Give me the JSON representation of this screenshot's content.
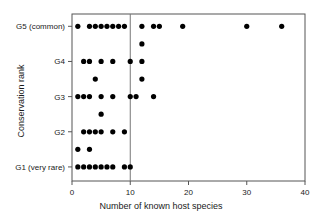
{
  "chart_data": {
    "type": "scatter",
    "title": "",
    "xlabel": "Number of known host species",
    "ylabel": "Conservation rank",
    "xlim": [
      0,
      40
    ],
    "ylim": [
      0.6,
      5.35
    ],
    "grid": false,
    "legend": null,
    "x_ticks": [
      0,
      10,
      20,
      30,
      40
    ],
    "x_tick_labels": [
      "0",
      "10",
      "20",
      "30",
      "40"
    ],
    "y_ticks": [
      1,
      2,
      3,
      4,
      5
    ],
    "y_tick_labels": [
      "G1 (very rare)",
      "G2",
      "G3",
      "G4",
      "G5 (common)"
    ],
    "reference_line_x": 10,
    "marker": "filled-circle",
    "marker_color": "#000000",
    "points": [
      {
        "x": 1,
        "y": 5
      },
      {
        "x": 3,
        "y": 5
      },
      {
        "x": 4,
        "y": 5
      },
      {
        "x": 5,
        "y": 5
      },
      {
        "x": 6,
        "y": 5
      },
      {
        "x": 7,
        "y": 5
      },
      {
        "x": 8,
        "y": 5
      },
      {
        "x": 9,
        "y": 5
      },
      {
        "x": 12,
        "y": 5
      },
      {
        "x": 14,
        "y": 5
      },
      {
        "x": 15,
        "y": 5
      },
      {
        "x": 19,
        "y": 5
      },
      {
        "x": 30,
        "y": 5
      },
      {
        "x": 36,
        "y": 5
      },
      {
        "x": 12,
        "y": 4.5
      },
      {
        "x": 2,
        "y": 4
      },
      {
        "x": 3,
        "y": 4
      },
      {
        "x": 5,
        "y": 4
      },
      {
        "x": 7,
        "y": 4
      },
      {
        "x": 10,
        "y": 4
      },
      {
        "x": 12,
        "y": 4
      },
      {
        "x": 4,
        "y": 3.5
      },
      {
        "x": 12,
        "y": 3.5
      },
      {
        "x": 1,
        "y": 3
      },
      {
        "x": 2,
        "y": 3
      },
      {
        "x": 3,
        "y": 3
      },
      {
        "x": 5,
        "y": 3
      },
      {
        "x": 7,
        "y": 3
      },
      {
        "x": 10,
        "y": 3
      },
      {
        "x": 11,
        "y": 3
      },
      {
        "x": 14,
        "y": 3
      },
      {
        "x": 5,
        "y": 2.5
      },
      {
        "x": 2,
        "y": 2
      },
      {
        "x": 3,
        "y": 2
      },
      {
        "x": 4,
        "y": 2
      },
      {
        "x": 5,
        "y": 2
      },
      {
        "x": 7,
        "y": 2
      },
      {
        "x": 9,
        "y": 2
      },
      {
        "x": 1,
        "y": 1.5
      },
      {
        "x": 3,
        "y": 1.5
      },
      {
        "x": 1,
        "y": 1
      },
      {
        "x": 2,
        "y": 1
      },
      {
        "x": 3,
        "y": 1
      },
      {
        "x": 4,
        "y": 1
      },
      {
        "x": 5,
        "y": 1
      },
      {
        "x": 6,
        "y": 1
      },
      {
        "x": 7,
        "y": 1
      },
      {
        "x": 9,
        "y": 1
      },
      {
        "x": 10,
        "y": 1
      }
    ]
  }
}
